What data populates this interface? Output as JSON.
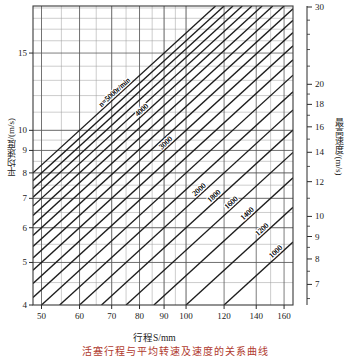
{
  "chart_data": {
    "type": "line",
    "title": "",
    "subtitle": "",
    "xlabel": "行程S/mm",
    "ylabel": "平均速度/(m/s)",
    "y2label": "最高速度/(m/s)",
    "xscale": "log",
    "yscale": "log",
    "xlim": [
      48,
      167
    ],
    "ylim": [
      4,
      19.2
    ],
    "y2lim": [
      6.28,
      30.2
    ],
    "grid": true,
    "legend_position": "inline-labels",
    "xticks": [
      50,
      60,
      70,
      80,
      90,
      100,
      120,
      140,
      160
    ],
    "xtick_labels": [
      "50",
      "60",
      "70",
      "80",
      "90",
      "100",
      "120",
      "140",
      "160"
    ],
    "yticks": [
      4,
      5,
      6,
      7,
      8,
      9,
      10,
      15
    ],
    "ytick_labels": [
      "4",
      "5",
      "6",
      "7",
      "8",
      "9",
      "10",
      "15"
    ],
    "y2ticks": [
      7,
      8,
      9,
      10,
      12,
      14,
      16,
      18,
      20,
      30
    ],
    "y2tick_labels": [
      "7",
      "8",
      "9",
      "10",
      "12",
      "14",
      "16",
      "18",
      "20",
      "30"
    ],
    "y2_factor": 1.5708,
    "series_unit": "r/min",
    "series_note": "v = 2 n S / 60000  (S in mm, n in r/min)",
    "series": [
      {
        "name": "n=5000r/min",
        "n": 5000,
        "label": "n=5000r/min",
        "labeled": true
      },
      {
        "name": "4800",
        "n": 4800,
        "label": "",
        "labeled": false
      },
      {
        "name": "4600",
        "n": 4600,
        "label": "",
        "labeled": false
      },
      {
        "name": "4400",
        "n": 4400,
        "label": "",
        "labeled": false
      },
      {
        "name": "4200",
        "n": 4200,
        "label": "",
        "labeled": false
      },
      {
        "name": "4000",
        "n": 4000,
        "label": "4000",
        "labeled": true
      },
      {
        "name": "3800",
        "n": 3800,
        "label": "",
        "labeled": false
      },
      {
        "name": "3600",
        "n": 3600,
        "label": "",
        "labeled": false
      },
      {
        "name": "3400",
        "n": 3400,
        "label": "",
        "labeled": false
      },
      {
        "name": "3200",
        "n": 3200,
        "label": "",
        "labeled": false
      },
      {
        "name": "3000",
        "n": 3000,
        "label": "3000",
        "labeled": true
      },
      {
        "name": "2800",
        "n": 2800,
        "label": "",
        "labeled": false
      },
      {
        "name": "2600",
        "n": 2600,
        "label": "",
        "labeled": false
      },
      {
        "name": "2400",
        "n": 2400,
        "label": "",
        "labeled": false
      },
      {
        "name": "2200",
        "n": 2200,
        "label": "",
        "labeled": false
      },
      {
        "name": "2000",
        "n": 2000,
        "label": "2000",
        "labeled": true
      },
      {
        "name": "1800",
        "n": 1800,
        "label": "1800",
        "labeled": true
      },
      {
        "name": "1600",
        "n": 1600,
        "label": "1600",
        "labeled": true
      },
      {
        "name": "1400",
        "n": 1400,
        "label": "1400",
        "labeled": true
      },
      {
        "name": "1200",
        "n": 1200,
        "label": "1200",
        "labeled": true
      },
      {
        "name": "1000",
        "n": 1000,
        "label": "1000",
        "labeled": true
      }
    ]
  },
  "axes": {
    "x_title": "行程S/mm",
    "y_left_title": "平均速度/(m/s)",
    "y_right_title": "最高速度/(m/s)"
  },
  "caption": {
    "text": "活塞行程与平均转速及速度的关系曲线"
  }
}
